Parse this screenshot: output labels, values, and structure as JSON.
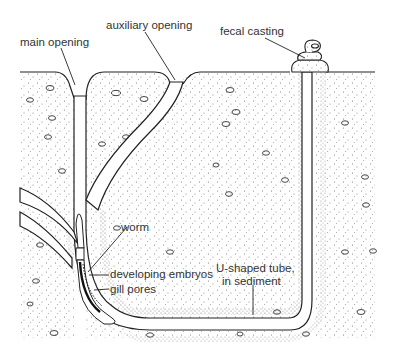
{
  "diagram": {
    "labels": {
      "main_opening": "main opening",
      "auxiliary_opening": "auxiliary opening",
      "fecal_casting": "fecal casting",
      "worm": "worm",
      "developing_embryos": "developing embryos",
      "gill_pores": "gill pores",
      "u_tube_line1": "U-shaped tube,",
      "u_tube_line2": "in sediment"
    },
    "colors": {
      "background": "#ffffff",
      "sediment_stipple": "#555555",
      "outline": "#222222",
      "tube_fill": "#ffffff"
    }
  }
}
